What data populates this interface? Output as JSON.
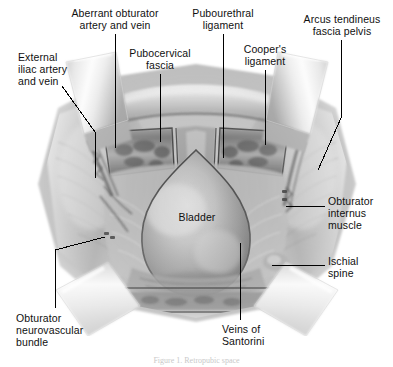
{
  "figure": {
    "caption": "Figure 1. Retropubic space",
    "background_color": "#ffffff",
    "ink_color": "#101010",
    "width": 393,
    "height": 367
  },
  "labels": [
    {
      "id": "aberrant-obturator-artery-and-vein",
      "text": "Aberrant obturator\nartery and vein",
      "align": "center",
      "x": 50,
      "y": 8,
      "w": 130
    },
    {
      "id": "pubourethral-ligament",
      "text": "Pubourethral\nligament",
      "align": "center",
      "x": 178,
      "y": 8,
      "w": 90
    },
    {
      "id": "arcus-tendineus-fascia-pelvis",
      "text": "Arcus tendineus\nfascia pelvis",
      "align": "center",
      "x": 292,
      "y": 14,
      "w": 100
    },
    {
      "id": "pubocervical-fascia",
      "text": "Pubocervical\nfascia",
      "align": "center",
      "x": 118,
      "y": 48,
      "w": 84
    },
    {
      "id": "coopers-ligament",
      "text": "Cooper's\nligament",
      "align": "center",
      "x": 233,
      "y": 44,
      "w": 64
    },
    {
      "id": "external-iliac-artery-and-vein",
      "text": "External\niliac artery\nand vein",
      "align": "left",
      "x": 18,
      "y": 52,
      "w": 80
    },
    {
      "id": "obturator-internus-muscle",
      "text": "Obturator\ninternus\nmuscle",
      "align": "left",
      "x": 328,
      "y": 196,
      "w": 65
    },
    {
      "id": "ischial-spine",
      "text": "Ischial\nspine",
      "align": "left",
      "x": 328,
      "y": 256,
      "w": 60
    },
    {
      "id": "bladder",
      "text": "Bladder",
      "align": "center",
      "x": 152,
      "y": 212,
      "w": 90
    },
    {
      "id": "veins-of-santorini",
      "text": "Veins of\nSantorini",
      "align": "left",
      "x": 222,
      "y": 324,
      "w": 72
    },
    {
      "id": "obturator-neurovascular-bundle",
      "text": "Obturator\nneurovascular\nbundle",
      "align": "left",
      "x": 16,
      "y": 313,
      "w": 92
    }
  ],
  "leader_lines": [
    {
      "id": "leader-aberrant-obturator",
      "points": "115,34 115,148"
    },
    {
      "id": "leader-pubourethral",
      "points": "223,34 223,158"
    },
    {
      "id": "leader-arcus-tendineus",
      "points": "341,40 341,118 318,170"
    },
    {
      "id": "leader-pubocervical",
      "points": "160,74 160,142"
    },
    {
      "id": "leader-coopers",
      "points": "265,70 265,145"
    },
    {
      "id": "leader-external-iliac",
      "points": "62,86 95,132 95,178"
    },
    {
      "id": "leader-obturator-internus",
      "points": "325,206 286,206"
    },
    {
      "id": "leader-ischial-spine",
      "points": "325,265 272,265"
    },
    {
      "id": "leader-veins-of-santorini",
      "points": "240,320 240,243"
    },
    {
      "id": "leader-obturator-neurovascular",
      "points": "55,308 55,250 105,237"
    }
  ],
  "anatomy_regions": [
    {
      "id": "bladder-dome",
      "name": "Bladder"
    },
    {
      "id": "pubic-symphysis",
      "name": "Pubic symphysis / arch"
    },
    {
      "id": "retractor-blade-upper-left",
      "name": "Retractor blade"
    },
    {
      "id": "retractor-blade-upper-right",
      "name": "Retractor blade"
    },
    {
      "id": "retractor-blade-lower-left",
      "name": "Retractor blade"
    },
    {
      "id": "retractor-blade-lower-right",
      "name": "Retractor blade"
    },
    {
      "id": "pelvic-sidewall-left",
      "name": "Left pelvic sidewall"
    },
    {
      "id": "pelvic-sidewall-right",
      "name": "Right pelvic sidewall"
    },
    {
      "id": "vessel-bundle-left",
      "name": "External iliac vessels"
    },
    {
      "id": "vessel-bundle-right",
      "name": "Obturator neurovascular bundle"
    }
  ]
}
